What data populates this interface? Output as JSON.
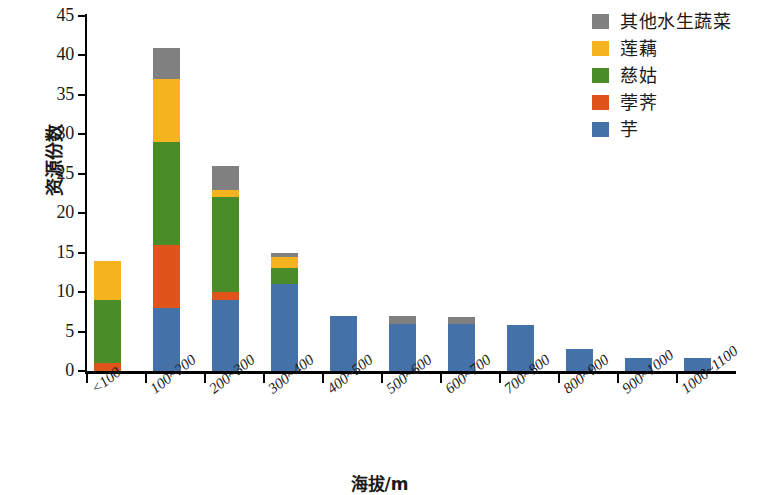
{
  "chart_data": {
    "type": "bar",
    "stacked": true,
    "title": "",
    "xlabel": "海拔/m",
    "ylabel": "资源份数",
    "ylim": [
      0,
      45
    ],
    "yticks": [
      0,
      5,
      10,
      15,
      20,
      25,
      30,
      35,
      40,
      45
    ],
    "grid": false,
    "legend_position": "top-right",
    "categories": [
      "<100",
      "100~200",
      "200~300",
      "300~400",
      "400~500",
      "500~600",
      "600~700",
      "700~800",
      "800~900",
      "900~1000",
      "1000~1100"
    ],
    "series": [
      {
        "name": "芋",
        "color": "#4472a8",
        "values": [
          0,
          8,
          9,
          11,
          7,
          6,
          6,
          5.8,
          2.8,
          1.7,
          1.7
        ]
      },
      {
        "name": "荸荠",
        "color": "#e0531a",
        "values": [
          1,
          8,
          1,
          0,
          0,
          0,
          0,
          0,
          0,
          0,
          0
        ]
      },
      {
        "name": "慈姑",
        "color": "#4a8c28",
        "values": [
          8,
          13,
          12,
          2,
          0,
          0,
          0,
          0,
          0,
          0,
          0
        ]
      },
      {
        "name": "莲藕",
        "color": "#f5b320",
        "values": [
          5,
          8,
          1,
          1.5,
          0,
          0,
          0,
          0,
          0,
          0,
          0
        ]
      },
      {
        "name": "其他水生蔬菜",
        "color": "#808080",
        "values": [
          0,
          4,
          3,
          0.5,
          0,
          1,
          0.8,
          0,
          0,
          0,
          0
        ]
      }
    ],
    "totals": [
      14,
      41,
      26,
      15,
      7,
      7,
      6.8,
      5.8,
      2.8,
      1.7,
      1.7
    ]
  },
  "legend": {
    "items": [
      {
        "label": "其他水生蔬菜",
        "color": "#808080"
      },
      {
        "label": "莲藕",
        "color": "#f5b320"
      },
      {
        "label": "慈姑",
        "color": "#4a8c28"
      },
      {
        "label": "荸荠",
        "color": "#e0531a"
      },
      {
        "label": "芋",
        "color": "#4472a8"
      }
    ]
  },
  "axes": {
    "y_title": "资源份数",
    "x_title": "海拔/m",
    "y_tick_labels": [
      "0",
      "5",
      "10",
      "15",
      "20",
      "25",
      "30",
      "35",
      "40",
      "45"
    ],
    "x_tick_labels": [
      "<100",
      "100~200",
      "200~300",
      "300~400",
      "400~500",
      "500~600",
      "600~700",
      "700~800",
      "800~900",
      "900~1000",
      "1000~1100"
    ]
  }
}
